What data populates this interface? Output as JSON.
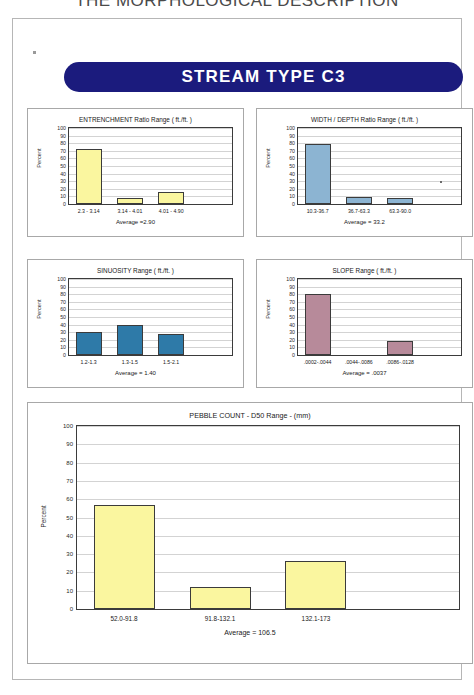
{
  "page": {
    "title": "THE MORPHOLOGICAL DESCRIPTION",
    "banner_label": "STREAM  TYPE  C3",
    "banner_color": "#1b1b7d",
    "banner_text_color": "#ffffff"
  },
  "axis": {
    "y_ticks": [
      "100",
      "90",
      "80",
      "70",
      "60",
      "50",
      "40",
      "30",
      "20",
      "10",
      "0"
    ],
    "y_label": "Percent"
  },
  "colors": {
    "yellow": "#faf69f",
    "light_blue": "#8cb4d2",
    "steel_blue": "#2e7aa8",
    "mauve": "#b78a9a",
    "bar_outline": "#3b3b3b",
    "grid": "#d3d3d3",
    "panel_border": "#a8a8a8"
  },
  "chart_data": [
    {
      "id": "entrenchment",
      "type": "bar",
      "title": "ENTRENCHMENT Ratio Range ( ft./ft. )",
      "categories": [
        "2.3 - 3.14",
        "3.14 - 4.01",
        "4.01 - 4.90"
      ],
      "values": [
        72,
        8,
        16
      ],
      "bar_color": "#faf69f",
      "average_label": "Average =2.90",
      "average_value": 2.9,
      "xlabel": "",
      "ylabel": "Percent",
      "ylim": [
        0,
        100
      ],
      "grid": true
    },
    {
      "id": "width-depth",
      "type": "bar",
      "title": "WIDTH / DEPTH Ratio Range ( ft./ft. )",
      "categories": [
        "10.3-36.7",
        "36.7-63.3",
        "63.3-90.0"
      ],
      "values": [
        79,
        9,
        8
      ],
      "bar_color": "#8cb4d2",
      "average_label": "Average = 33.2",
      "average_value": 33.2,
      "xlabel": "",
      "ylabel": "Percent",
      "ylim": [
        0,
        100
      ],
      "grid": true
    },
    {
      "id": "sinuosity",
      "type": "bar",
      "title": "SINUOSITY  Range ( ft./ft. )",
      "categories": [
        "1.2-1.3",
        "1.3-1.5",
        "1.5-2.1"
      ],
      "values": [
        30,
        39,
        28
      ],
      "bar_color": "#2e7aa8",
      "average_label": "Average = 1.40",
      "average_value": 1.4,
      "xlabel": "",
      "ylabel": "Percent",
      "ylim": [
        0,
        100
      ],
      "grid": true
    },
    {
      "id": "slope",
      "type": "bar",
      "title": "SLOPE  Range ( ft./ft. )",
      "categories": [
        ".0002-.0044",
        ".0044-.0086",
        ".0086-.0128"
      ],
      "values": [
        80,
        0,
        18
      ],
      "bar_color": "#b78a9a",
      "average_label": "Average = .0037",
      "average_value": 0.0037,
      "xlabel": "",
      "ylabel": "Percent",
      "ylim": [
        0,
        100
      ],
      "grid": true
    },
    {
      "id": "pebble-count",
      "type": "bar",
      "title": "PEBBLE COUNT  -  D50 Range  -  (mm)",
      "categories": [
        "52.0-91.8",
        "91.8-132.1",
        "132.1-173"
      ],
      "values": [
        57,
        12,
        26
      ],
      "bar_color": "#faf69f",
      "average_label": "Average =  106.5",
      "average_value": 106.5,
      "xlabel": "",
      "ylabel": "Percent",
      "ylim": [
        0,
        100
      ],
      "grid": true
    }
  ]
}
